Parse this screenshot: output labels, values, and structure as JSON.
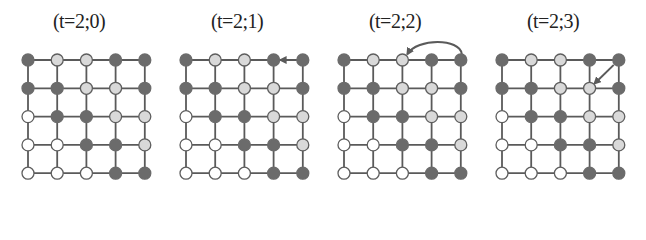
{
  "figure": {
    "colors": {
      "dark": "#6b6b6b",
      "light": "#d9d9d9",
      "white": "#ffffff",
      "stroke": "#5e5e5e",
      "edge": "#5a5a5a"
    },
    "grid": {
      "rows": 5,
      "cols": 5,
      "origin_x": 28,
      "origin_y": 60,
      "spacing_x": 29.2,
      "spacing_y": 28.3,
      "node_radius": 6
    },
    "states": [
      [
        "D",
        "L",
        "L",
        "D",
        "D"
      ],
      [
        "D",
        "D",
        "L",
        "L",
        "D"
      ],
      [
        "W",
        "D",
        "D",
        "L",
        "L"
      ],
      [
        "W",
        "W",
        "D",
        "D",
        "L"
      ],
      [
        "W",
        "W",
        "W",
        "D",
        "D"
      ]
    ],
    "panels": [
      {
        "title": "(t=2;0)",
        "offset_x": 0,
        "arrow": null
      },
      {
        "title": "(t=2;1)",
        "offset_x": 158,
        "arrow": {
          "type": "straight",
          "from": [
            0,
            4
          ],
          "to": [
            0,
            3
          ]
        }
      },
      {
        "title": "(t=2;2)",
        "offset_x": 316,
        "arrow": {
          "type": "curved",
          "from": [
            0,
            4
          ],
          "to": [
            0,
            2
          ]
        }
      },
      {
        "title": "(t=2;3)",
        "offset_x": 474,
        "arrow": {
          "type": "straight",
          "from": [
            0,
            4
          ],
          "to": [
            1,
            3
          ]
        }
      }
    ]
  }
}
